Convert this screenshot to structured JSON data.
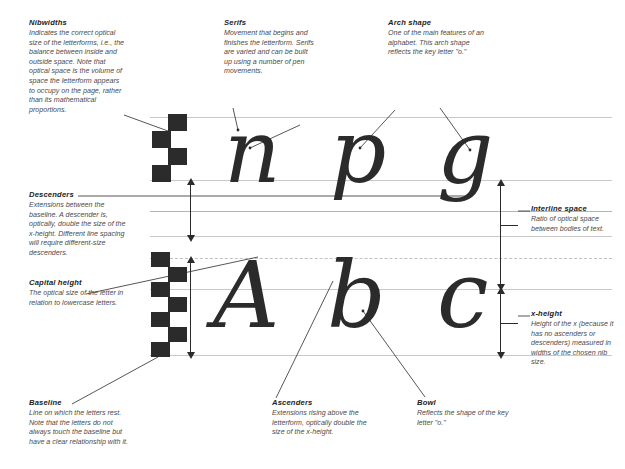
{
  "diagram": {
    "colors": {
      "ink": "#2b2b2b",
      "guideline": "#c8c8c8",
      "text": "#4a4a4a",
      "heading": "#1d1d1d",
      "background": "#ffffff"
    }
  },
  "notes": [
    {
      "id": "nibwidths",
      "title": "Nibwidths",
      "body": "Indicates the correct optical size of the letterforms, i.e., the balance between inside and outside space. Note that optical space is the volume of space the letterform appears to occupy on the page, rather than its mathematical proportions."
    },
    {
      "id": "serifs",
      "title": "Serifs",
      "body": "Movement that begins and finishes the letterform. Serifs are varied and can be built up using a number of pen movements."
    },
    {
      "id": "arch-shape",
      "title": "Arch shape",
      "body": "One of the main features of an alphabet. This arch shape reflects the key letter \"o.\""
    },
    {
      "id": "descenders",
      "title": "Descenders",
      "body": "Extensions between the baseline. A descender is, optically, double the size of the x-height. Different line spacing will require different-size descenders."
    },
    {
      "id": "capital-height",
      "title": "Capital height",
      "body": "The optical size of the letter in relation to lowercase letters."
    },
    {
      "id": "interline-space",
      "title": "Interline space",
      "body": "Ratio of optical space between bodies of text."
    },
    {
      "id": "x-height",
      "title": "x-height",
      "body": "Height of the x (because it has no ascenders or descenders) measured in widths of the chosen nib size."
    },
    {
      "id": "baseline",
      "title": "Baseline",
      "body": "Line on which the letters rest. Note that the letters do not always touch the baseline but have a clear relationship with it."
    },
    {
      "id": "ascenders",
      "title": "Ascenders",
      "body": "Extensions rising above the letterform, optically double the size of the x-height."
    },
    {
      "id": "bowl",
      "title": "Bowl",
      "body": "Reflects the shape of the key letter \"o.\""
    }
  ],
  "letters": {
    "row1": [
      "n",
      "p",
      "g"
    ],
    "row2": [
      "A",
      "b",
      "c"
    ]
  },
  "nibwidths": {
    "top_count": 4,
    "bottom_count": 7
  }
}
